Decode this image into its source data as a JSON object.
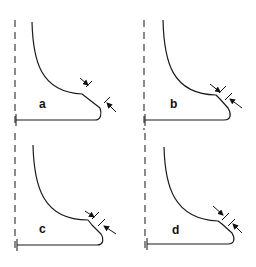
{
  "figure": {
    "panels": [
      {
        "id": "a",
        "label": "a"
      },
      {
        "id": "b",
        "label": "b"
      },
      {
        "id": "c",
        "label": "c"
      },
      {
        "id": "d",
        "label": "d"
      }
    ],
    "colors": {
      "stroke": "#1a1a1a",
      "background": "#ffffff"
    }
  }
}
